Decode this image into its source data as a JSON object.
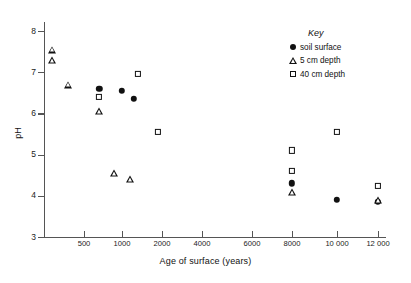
{
  "chart_data": {
    "type": "scatter",
    "title": "",
    "xlabel": "Age of surface (years)",
    "ylabel": "pH",
    "grid": false,
    "legend_position": "top-right",
    "legend_title": "Key",
    "ylim": [
      3,
      8
    ],
    "y_ticks": [
      3,
      4,
      5,
      6,
      7,
      8
    ],
    "y_tick_labels": [
      "3",
      "4",
      "5",
      "6",
      "7",
      "8"
    ],
    "x_ticks": [
      500,
      1000,
      2000,
      4000,
      6000,
      8000,
      10000,
      12000
    ],
    "x_tick_labels": [
      "500",
      "1000",
      "2000",
      "4000",
      "6000",
      "8000",
      "10 000",
      "12 000"
    ],
    "x_scale_note": "non-linear compressed axis",
    "series": [
      {
        "name": "soil surface",
        "marker": "filled-circle",
        "color": "#111111",
        "points": [
          {
            "x": 700,
            "y": 6.6
          },
          {
            "x": 1000,
            "y": 6.55
          },
          {
            "x": 1300,
            "y": 6.35
          },
          {
            "x": 8000,
            "y": 4.3
          },
          {
            "x": 10000,
            "y": 3.9
          },
          {
            "x": 12000,
            "y": 3.85
          }
        ]
      },
      {
        "name": "5 cm depth",
        "marker": "open-triangle",
        "color": "#111111",
        "points": [
          {
            "x": 100,
            "y": 7.55
          },
          {
            "x": 100,
            "y": 7.3
          },
          {
            "x": 300,
            "y": 6.7
          },
          {
            "x": 700,
            "y": 6.05
          },
          {
            "x": 900,
            "y": 4.55
          },
          {
            "x": 1200,
            "y": 4.4
          },
          {
            "x": 8000,
            "y": 4.1
          },
          {
            "x": 12000,
            "y": 3.9
          }
        ]
      },
      {
        "name": "40 cm depth",
        "marker": "open-square",
        "color": "#111111",
        "points": [
          {
            "x": 700,
            "y": 6.4
          },
          {
            "x": 1400,
            "y": 6.95
          },
          {
            "x": 1900,
            "y": 5.55
          },
          {
            "x": 8000,
            "y": 5.1
          },
          {
            "x": 8000,
            "y": 4.6
          },
          {
            "x": 10000,
            "y": 5.55
          },
          {
            "x": 12000,
            "y": 4.25
          }
        ]
      }
    ]
  },
  "legend": {
    "title": "Key",
    "entries": [
      {
        "label": "soil surface",
        "marker": "filled-circle"
      },
      {
        "label": "5 cm depth",
        "marker": "open-triangle"
      },
      {
        "label": "40 cm depth",
        "marker": "open-square"
      }
    ]
  },
  "axes": {
    "x_title": "Age of surface (years)",
    "y_title": "pH"
  }
}
